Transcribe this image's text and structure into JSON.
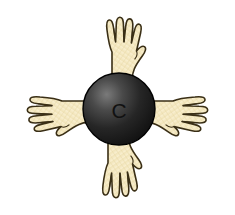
{
  "figure": {
    "background_color": "#ffffff",
    "width": 235,
    "height": 215
  },
  "atom": {
    "label": "C",
    "element_name": "carbon",
    "center": {
      "x": 119,
      "y": 109
    },
    "radius": 36,
    "fill_dark": "#1c1c1c",
    "fill_light": "#6e6e6e",
    "outline_color": "#000000",
    "label_color": "#111111"
  },
  "hands": [
    {
      "id": "hand-up",
      "direction": "up",
      "position": "top",
      "bond_number": 1,
      "fill": "#f6e9c2",
      "outline": "#3a2f16"
    },
    {
      "id": "hand-right",
      "direction": "right",
      "position": "right",
      "bond_number": 2,
      "fill": "#f6e9c2",
      "outline": "#3a2f16"
    },
    {
      "id": "hand-down",
      "direction": "down",
      "position": "bottom",
      "bond_number": 3,
      "fill": "#f6e9c2",
      "outline": "#3a2f16"
    },
    {
      "id": "hand-left",
      "direction": "left",
      "position": "left",
      "bond_number": 4,
      "fill": "#f6e9c2",
      "outline": "#3a2f16"
    }
  ],
  "colors": {
    "hand_fill": "#f6e9c2",
    "hand_outline": "#3a2f16",
    "atom_fill_dark": "#1c1c1c",
    "atom_fill_light": "#6e6e6e",
    "background": "#ffffff"
  }
}
